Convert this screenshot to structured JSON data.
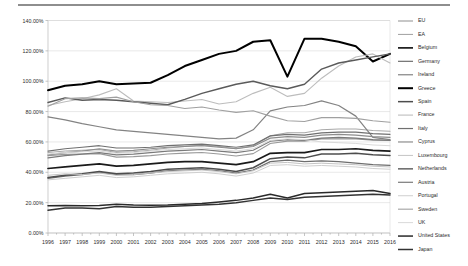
{
  "chart_data": {
    "type": "line",
    "title": "",
    "xlabel": "",
    "ylabel": "",
    "ylim": [
      0,
      140
    ],
    "yticks": [
      "0.00%",
      "20.00%",
      "40.00%",
      "60.00%",
      "80.00%",
      "100.00%",
      "120.00%",
      "140.00%"
    ],
    "ytick_values": [
      0,
      20,
      40,
      60,
      80,
      100,
      120,
      140
    ],
    "grid": true,
    "legend_position": "right",
    "x": [
      1996,
      1997,
      1998,
      1999,
      2000,
      2001,
      2002,
      2003,
      2004,
      2005,
      2006,
      2007,
      2008,
      2009,
      2010,
      2011,
      2012,
      2013,
      2014,
      2015,
      2016
    ],
    "xtick_labels": [
      "1996",
      "1997",
      "1998",
      "1999",
      "2000",
      "2001",
      "2002",
      "2003",
      "2004",
      "2005",
      "2006",
      "2007",
      "2008",
      "2009",
      "2010",
      "2011",
      "2012",
      "2013",
      "2014",
      "2015",
      "2016"
    ],
    "series": [
      {
        "name": "EU",
        "color": "#9a9a9a",
        "width": 1.1,
        "values": [
          51.0,
          51.8,
          52.0,
          52.3,
          50.0,
          50.3,
          51.0,
          52.0,
          52.6,
          53.0,
          52.0,
          50.7,
          52.3,
          59.0,
          60.5,
          60.5,
          62.0,
          62.0,
          62.0,
          61.2,
          61.0
        ]
      },
      {
        "name": "EA",
        "color": "#a8a8a8",
        "width": 1.1,
        "values": [
          53.0,
          54.0,
          54.5,
          55.0,
          53.0,
          53.5,
          54.5,
          56.0,
          57.0,
          58.0,
          57.0,
          55.5,
          57.5,
          64.0,
          66.0,
          66.0,
          68.0,
          68.5,
          68.5,
          67.5,
          67.0
        ]
      },
      {
        "name": "Belgium",
        "color": "#1a1a1a",
        "width": 1.7,
        "values": [
          42.5,
          43.5,
          44.5,
          45.5,
          44.0,
          44.5,
          45.5,
          46.5,
          47.0,
          47.0,
          46.0,
          45.0,
          47.0,
          52.5,
          53.0,
          53.0,
          55.0,
          55.0,
          55.5,
          54.5,
          54.0
        ]
      },
      {
        "name": "Germany",
        "color": "#6e6e6e",
        "width": 1.2,
        "values": [
          36.0,
          37.5,
          38.5,
          40.0,
          38.5,
          38.5,
          39.5,
          41.0,
          41.5,
          42.0,
          41.0,
          39.5,
          41.5,
          47.0,
          48.0,
          47.0,
          47.5,
          47.0,
          46.0,
          45.0,
          44.5
        ]
      },
      {
        "name": "Ireland",
        "color": "#838383",
        "width": 1.2,
        "values": [
          76.5,
          74.5,
          72.0,
          70.0,
          68.0,
          67.0,
          66.0,
          65.0,
          64.0,
          63.0,
          62.0,
          62.5,
          68.0,
          80.5,
          83.0,
          84.0,
          87.0,
          84.0,
          77.0,
          63.0,
          61.5
        ]
      },
      {
        "name": "Greece",
        "color": "#000000",
        "width": 2.0,
        "values": [
          94.0,
          97.0,
          98.0,
          100.0,
          98.0,
          98.5,
          99.0,
          104.0,
          110.0,
          114.0,
          118.0,
          120.0,
          126.0,
          127.0,
          103.0,
          128.0,
          128.0,
          126.0,
          123.0,
          113.0,
          118.0
        ]
      },
      {
        "name": "Spain",
        "color": "#4d4d4d",
        "width": 1.5,
        "values": [
          36.5,
          38.0,
          39.0,
          40.5,
          39.0,
          39.5,
          40.5,
          42.0,
          42.5,
          43.0,
          42.0,
          40.5,
          43.0,
          49.0,
          50.0,
          49.5,
          52.0,
          52.0,
          52.5,
          51.5,
          51.0
        ]
      },
      {
        "name": "France",
        "color": "#bdbdbd",
        "width": 1.1,
        "values": [
          84.0,
          86.5,
          88.5,
          91.0,
          95.0,
          87.0,
          86.5,
          86.0,
          87.0,
          88.0,
          85.0,
          86.5,
          92.0,
          96.0,
          90.0,
          92.0,
          102.0,
          110.0,
          116.0,
          118.0,
          112.0
        ]
      },
      {
        "name": "Italy",
        "color": "#707070",
        "width": 1.2,
        "values": [
          54.0,
          55.5,
          56.5,
          57.5,
          56.0,
          56.0,
          56.5,
          57.5,
          58.0,
          58.5,
          57.5,
          56.5,
          58.0,
          64.0,
          65.0,
          64.5,
          66.0,
          66.5,
          66.5,
          65.5,
          65.0
        ]
      },
      {
        "name": "Cyprus",
        "color": "#8d8d8d",
        "width": 1.2,
        "values": [
          51.5,
          53.0,
          54.0,
          55.5,
          54.0,
          54.5,
          55.5,
          56.5,
          57.0,
          57.5,
          56.5,
          55.5,
          57.0,
          62.5,
          63.5,
          63.0,
          64.5,
          65.0,
          64.5,
          63.5,
          63.0
        ]
      },
      {
        "name": "Luxembourg",
        "color": "#c4c4c4",
        "width": 1.0,
        "values": [
          38.0,
          39.0,
          38.5,
          39.5,
          38.0,
          38.5,
          39.5,
          40.5,
          41.0,
          41.5,
          40.5,
          39.0,
          41.0,
          46.0,
          46.5,
          45.5,
          46.0,
          45.5,
          45.0,
          44.0,
          43.5
        ]
      },
      {
        "name": "Netherlands",
        "color": "#5a5a5a",
        "width": 1.4,
        "values": [
          86.0,
          89.0,
          87.5,
          88.0,
          87.5,
          86.5,
          85.5,
          84.5,
          88.0,
          92.0,
          95.0,
          98.0,
          100.0,
          97.0,
          95.0,
          98.0,
          108.0,
          112.0,
          114.0,
          116.0,
          118.0
        ]
      },
      {
        "name": "Austria",
        "color": "#7a7a7a",
        "width": 1.2,
        "values": [
          49.5,
          51.0,
          52.0,
          53.0,
          51.5,
          52.0,
          53.0,
          54.0,
          54.5,
          55.0,
          54.0,
          53.0,
          54.5,
          60.5,
          61.5,
          61.0,
          62.5,
          63.0,
          62.5,
          61.5,
          61.0
        ]
      },
      {
        "name": "Portugal",
        "color": "#cfcfcf",
        "width": 1.0,
        "values": [
          35.0,
          36.0,
          37.0,
          38.0,
          36.5,
          37.0,
          38.0,
          39.0,
          39.5,
          40.0,
          39.0,
          37.5,
          39.5,
          44.5,
          45.0,
          44.0,
          44.5,
          44.0,
          43.5,
          42.5,
          42.0
        ]
      },
      {
        "name": "Sweden",
        "color": "#a0a0a0",
        "width": 1.1,
        "values": [
          83.5,
          88.5,
          89.0,
          88.5,
          89.5,
          86.5,
          84.5,
          84.0,
          82.0,
          83.0,
          81.0,
          79.5,
          80.5,
          77.0,
          74.0,
          73.5,
          76.0,
          76.0,
          75.5,
          74.0,
          73.0
        ]
      },
      {
        "name": "UK",
        "color": "#d9d9d9",
        "width": 1.0,
        "values": [
          52.0,
          53.0,
          53.5,
          54.0,
          52.5,
          53.0,
          54.0,
          55.0,
          55.5,
          56.0,
          55.0,
          54.0,
          55.5,
          61.0,
          62.0,
          61.5,
          60.0,
          59.5,
          59.0,
          58.0,
          57.5
        ]
      },
      {
        "name": "United States",
        "color": "#2a2a2a",
        "width": 1.5,
        "values": [
          18.0,
          18.2,
          18.0,
          18.2,
          19.0,
          18.5,
          18.3,
          18.5,
          19.0,
          19.5,
          20.5,
          21.5,
          23.0,
          25.5,
          23.0,
          26.0,
          26.5,
          27.0,
          27.5,
          28.0,
          26.0
        ]
      },
      {
        "name": "Japan",
        "color": "#333333",
        "width": 1.5,
        "values": [
          15.0,
          16.5,
          16.5,
          16.0,
          17.5,
          17.0,
          17.0,
          17.5,
          18.0,
          18.5,
          19.0,
          20.0,
          21.5,
          23.0,
          22.0,
          23.5,
          24.0,
          24.5,
          25.0,
          25.5,
          25.0
        ]
      }
    ]
  },
  "legend": {
    "items": [
      "EU",
      "EA",
      "Belgium",
      "Germany",
      "Ireland",
      "Greece",
      "Spain",
      "France",
      "Italy",
      "Cyprus",
      "Luxembourg",
      "Netherlands",
      "Austria",
      "Portugal",
      "Sweden",
      "UK",
      "United States",
      "Japan"
    ]
  }
}
